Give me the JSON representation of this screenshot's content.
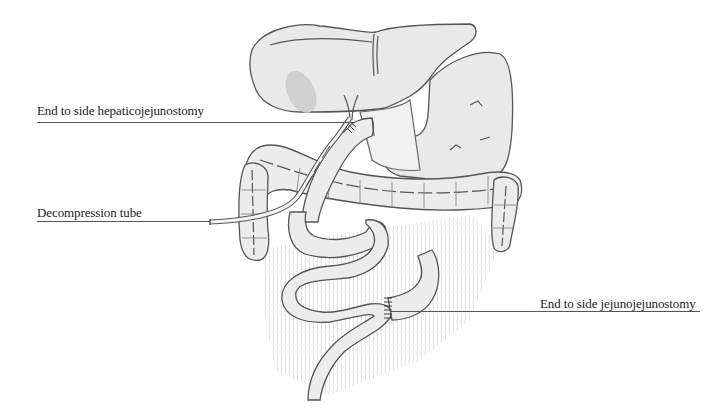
{
  "figure": {
    "labels": [
      {
        "id": "hepaticojejunostomy",
        "text": "End to side hepaticojejunostomy"
      },
      {
        "id": "decompression-tube",
        "text": "Decompression tube"
      },
      {
        "id": "jejunojejunostomy",
        "text": "End to side jejunojejunostomy"
      }
    ]
  }
}
